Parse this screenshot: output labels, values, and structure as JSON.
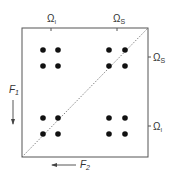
{
  "diagram": {
    "top_labels": [
      {
        "main": "Ω",
        "sub": "I"
      },
      {
        "main": "Ω",
        "sub": "S"
      }
    ],
    "right_labels": [
      {
        "main": "Ω",
        "sub": "S"
      },
      {
        "main": "Ω",
        "sub": "I"
      }
    ],
    "f1": {
      "main": "F",
      "sub": "1"
    },
    "f2": {
      "main": "F",
      "sub": "2"
    },
    "colors": {
      "line": "#555555",
      "dot": "#111111"
    }
  }
}
